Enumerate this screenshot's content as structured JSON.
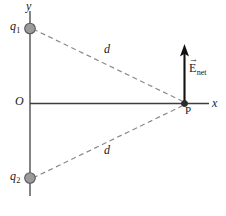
{
  "figure": {
    "colors": {
      "axis": "#3d3d3d",
      "y_axis": "#6e6e6e",
      "charge_fill": "#9b9b9b",
      "charge_stroke": "#5a5a5a",
      "dashed_line": "#8a8a8a",
      "vector": "#111111",
      "text": "#1a1a1a",
      "background": "#ffffff"
    },
    "axes": {
      "x_label": "x",
      "y_label": "y",
      "origin_label": "O"
    },
    "charges": [
      {
        "id": "q1",
        "label": "q",
        "subscript": "1",
        "x": 0,
        "y": 75
      },
      {
        "id": "q2",
        "label": "q",
        "subscript": "2",
        "x": 0,
        "y": -75
      }
    ],
    "field_point": {
      "label": "P",
      "x": 154,
      "y": 0
    },
    "distances": [
      {
        "id": "d-upper",
        "label": "d",
        "from": "q1",
        "to": "P"
      },
      {
        "id": "d-lower",
        "label": "d",
        "from": "q2",
        "to": "P"
      }
    ],
    "field_vector": {
      "symbol": "E",
      "subscript": "net",
      "arrow_glyph": "→",
      "direction": "up",
      "origin": "P"
    }
  }
}
